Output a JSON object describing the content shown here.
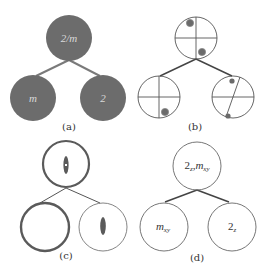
{
  "figure": {
    "panels": [
      {
        "id": "a",
        "label": "(a)",
        "style": "filled-circles",
        "fill_color": "#6c6c6c",
        "text_color": "#d9d9d9",
        "nodes": [
          {
            "role": "parent",
            "text": "2/m"
          },
          {
            "role": "child-left",
            "text": "m"
          },
          {
            "role": "child-right",
            "text": "2"
          }
        ]
      },
      {
        "id": "b",
        "label": "(b)",
        "style": "stereographic-projections",
        "line_color": "#444444",
        "dot_color": "#6a6a6a",
        "nodes": [
          {
            "role": "parent",
            "symmetry": "2/m",
            "marks": "cross with two dots"
          },
          {
            "role": "child-left",
            "symmetry": "m",
            "marks": "cross with one dot"
          },
          {
            "role": "child-right",
            "symmetry": "2",
            "marks": "horizontal line, slanted line, two dots"
          }
        ]
      },
      {
        "id": "c",
        "label": "(c)",
        "style": "symmetry-element-circles",
        "line_color": "#555555",
        "ellipse_color": "#555555",
        "nodes": [
          {
            "role": "parent",
            "marks": "thick circle with two-fold ellipse and center"
          },
          {
            "role": "child-left",
            "marks": "thick circle (mirror)"
          },
          {
            "role": "child-right",
            "marks": "thin circle with two-fold ellipse"
          }
        ]
      },
      {
        "id": "d",
        "label": "(d)",
        "style": "labeled-circles",
        "line_color": "#666666",
        "nodes": [
          {
            "role": "parent",
            "main": "2",
            "sub1": "z",
            "main2": "m",
            "sub2": "xy"
          },
          {
            "role": "child-left",
            "main": "m",
            "sub1": "xy"
          },
          {
            "role": "child-right",
            "main": "2",
            "sub1": "z"
          }
        ]
      }
    ]
  }
}
